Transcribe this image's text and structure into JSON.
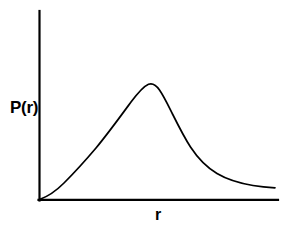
{
  "figure": {
    "width": 291,
    "height": 232,
    "background_color": "#ffffff",
    "line_color": "#000000",
    "axis_color": "#000000"
  },
  "labels": {
    "y_axis": "P(r)",
    "x_axis": "r"
  },
  "chart_data": {
    "type": "line",
    "title": "",
    "xlabel": "r",
    "ylabel": "P(r)",
    "grid": false,
    "legend": null,
    "axes": {
      "x_tick_labels": [],
      "y_tick_labels": [],
      "x_origin_px": 39,
      "y_origin_px": 200,
      "x_axis_end_px": 278,
      "y_axis_top_px": 11
    },
    "xlim": [
      0,
      1
    ],
    "ylim": [
      0,
      1
    ],
    "series": [
      {
        "name": "P(r)",
        "color": "#000000",
        "x": [
          0.0,
          0.04,
          0.08,
          0.13,
          0.17,
          0.21,
          0.25,
          0.29,
          0.33,
          0.38,
          0.42,
          0.46,
          0.5,
          0.54,
          0.58,
          0.63,
          0.67,
          0.71,
          0.75,
          0.79,
          0.84,
          0.88,
          0.92,
          0.96,
          1.0
        ],
        "y": [
          0.0,
          0.05,
          0.12,
          0.2,
          0.29,
          0.38,
          0.47,
          0.57,
          0.67,
          0.78,
          0.89,
          0.97,
          1.0,
          0.97,
          0.9,
          0.8,
          0.69,
          0.59,
          0.49,
          0.41,
          0.33,
          0.27,
          0.22,
          0.18,
          0.15
        ]
      }
    ],
    "peak": {
      "x": 0.5,
      "y": 1.0
    },
    "curve_path_px": "M 39 200 C 60 195 78 178 96 157 C 114 136 130 110 142 94 C 146 88 150 84 154 85 C 160 87 166 97 172 109 C 181 127 190 146 200 159 C 212 174 228 182 244 186 C 256 189 266 190 275 191"
  }
}
